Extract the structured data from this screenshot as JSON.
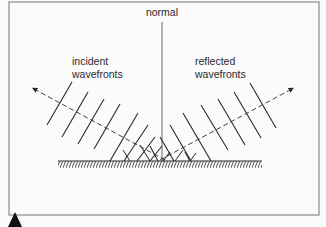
{
  "diagram": {
    "labels": {
      "normal": "normal",
      "incident_line1": "incident",
      "incident_line2": "wavefronts",
      "reflected_line1": "reflected",
      "reflected_line2": "wavefronts"
    },
    "colors": {
      "frame": "#8a8a8a",
      "line": "#2a2a2a",
      "background": "#fbfbfb"
    },
    "elements": {
      "incident_ray": "dashed arrow pointing up-left",
      "reflected_ray": "dashed arrow pointing up-right",
      "mirror": "hatched plane reflecting surface",
      "normal_line": "vertical line at point of incidence",
      "incident_wavefront_count": 9,
      "reflected_wavefront_count": 9
    }
  }
}
